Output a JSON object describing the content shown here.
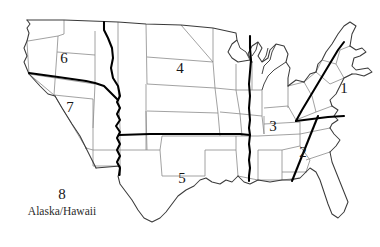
{
  "figure": {
    "background_color": "#ffffff",
    "state_border_color": "#8a8a8a",
    "coastline_color": "#3a3a3a",
    "divider_color": "#000000",
    "label_color": "#161616"
  },
  "regions": [
    {
      "id": "region-1",
      "label": "1",
      "name": "Northeast",
      "x": 344,
      "y": 88,
      "font_size": "15px"
    },
    {
      "id": "region-2",
      "label": "2",
      "name": "Southeast",
      "x": 303,
      "y": 152,
      "font_size": "15px"
    },
    {
      "id": "region-3",
      "label": "3",
      "name": "Mid-South",
      "x": 273,
      "y": 126,
      "font_size": "15px"
    },
    {
      "id": "region-4",
      "label": "4",
      "name": "Upper Midwest",
      "x": 180,
      "y": 68,
      "font_size": "15px"
    },
    {
      "id": "region-5",
      "label": "5",
      "name": "South Central",
      "x": 182,
      "y": 178,
      "font_size": "15px"
    },
    {
      "id": "region-6",
      "label": "6",
      "name": "Pacific Northwest",
      "x": 64,
      "y": 58,
      "font_size": "15px"
    },
    {
      "id": "region-7",
      "label": "7",
      "name": "Southwest",
      "x": 70,
      "y": 107,
      "font_size": "15px"
    },
    {
      "id": "region-8",
      "label": "8",
      "name": "Alaska/Hawaii",
      "x": 62,
      "y": 194,
      "font_size": "15px"
    }
  ],
  "captions": [
    {
      "id": "caption-region-8",
      "text": "Alaska/Hawaii",
      "x": 62,
      "y": 212
    }
  ]
}
